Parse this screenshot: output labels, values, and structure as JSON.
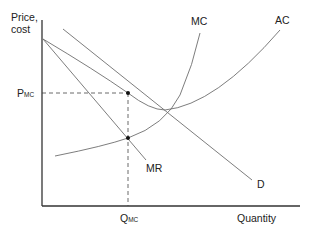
{
  "diagram": {
    "type": "economics-monopoly-cost-curves",
    "y_axis_label_line1": "Price,",
    "y_axis_label_line2": "cost",
    "x_axis_label": "Quantity",
    "price_marker": {
      "main": "P",
      "sub": "MC"
    },
    "quantity_marker": {
      "main": "Q",
      "sub": "MC"
    },
    "curves": {
      "mc": "MC",
      "ac": "AC",
      "mr": "MR",
      "d": "D"
    },
    "points": [
      {
        "name": "price-point",
        "x": 128,
        "y": 93
      },
      {
        "name": "mr-mc-intersection",
        "x": 128,
        "y": 138
      }
    ],
    "colors": {
      "curve": "#6e6e6e",
      "axis": "#333333",
      "text": "#222222"
    }
  }
}
